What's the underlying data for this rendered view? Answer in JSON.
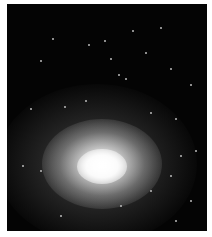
{
  "image": {
    "subject": "nebula-galaxy-photo",
    "background_color": "#040404",
    "frame_color": "#ffffff",
    "glow_center": [
      100,
      165
    ]
  },
  "stars": [
    [
      132,
      30
    ],
    [
      104,
      40
    ],
    [
      160,
      27
    ],
    [
      52,
      38
    ],
    [
      88,
      44
    ],
    [
      110,
      58
    ],
    [
      145,
      52
    ],
    [
      118,
      74
    ],
    [
      125,
      78
    ],
    [
      190,
      84
    ],
    [
      30,
      108
    ],
    [
      64,
      106
    ],
    [
      150,
      112
    ],
    [
      175,
      118
    ],
    [
      195,
      150
    ],
    [
      180,
      155
    ],
    [
      40,
      170
    ],
    [
      22,
      165
    ],
    [
      170,
      175
    ],
    [
      150,
      190
    ],
    [
      120,
      205
    ],
    [
      60,
      215
    ],
    [
      175,
      220
    ],
    [
      190,
      200
    ],
    [
      85,
      100
    ],
    [
      40,
      60
    ],
    [
      170,
      68
    ]
  ]
}
